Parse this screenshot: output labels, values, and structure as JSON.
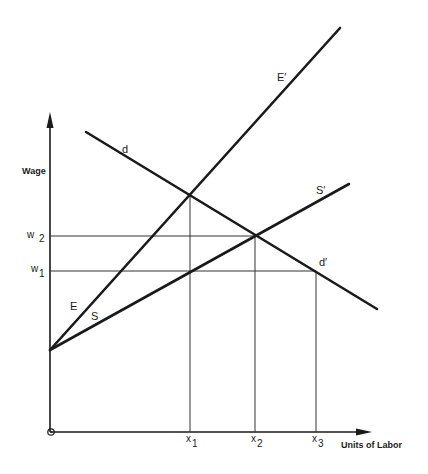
{
  "diagram": {
    "y_axis_label": "Wage",
    "x_axis_label": "Units of Labor",
    "origin_marker": "o",
    "wage_levels": [
      {
        "base": "w",
        "sub": "2",
        "id": "w2"
      },
      {
        "base": "w",
        "sub": "1",
        "id": "w1"
      }
    ],
    "labor_levels": [
      {
        "base": "x",
        "sub": "1",
        "id": "x1"
      },
      {
        "base": "x",
        "sub": "2",
        "id": "x2"
      },
      {
        "base": "x",
        "sub": "3",
        "id": "x3"
      }
    ],
    "curves": {
      "demand_start": "d",
      "demand_end": "d′",
      "E": "E",
      "E_prime": "E′",
      "S": "S",
      "S_prime": "S′"
    },
    "colors": {
      "line": "#1a1a1a",
      "background": "#ffffff"
    }
  }
}
